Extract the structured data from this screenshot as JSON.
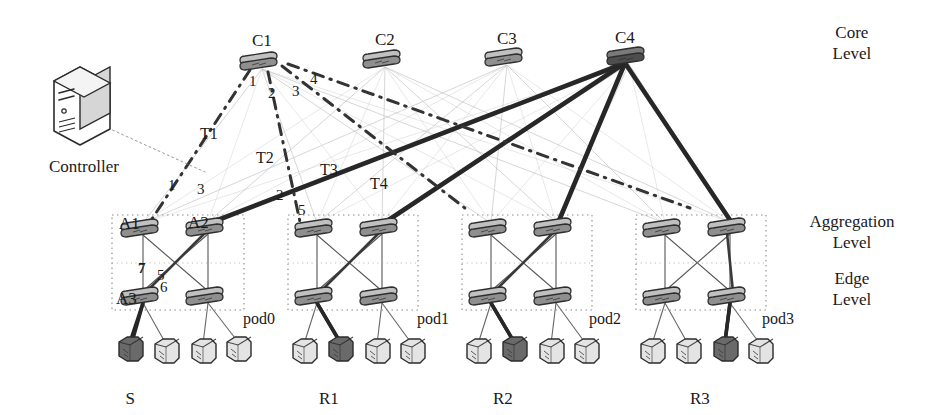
{
  "diagram": {
    "levels": [
      {
        "id": "core",
        "label_line1": "Core",
        "label_line2": "Level",
        "x": 852,
        "y": 22
      },
      {
        "id": "aggregation",
        "label_line1": "Aggregation",
        "label_line2": "Level",
        "x": 852,
        "y": 211
      },
      {
        "id": "edge",
        "label_line1": "Edge",
        "label_line2": "Level",
        "x": 852,
        "y": 268
      }
    ],
    "controller": {
      "label": "Controller",
      "x": 84,
      "y": 105,
      "label_x": 84,
      "label_y": 158
    },
    "core_switches": [
      {
        "id": "C1",
        "label": "C1",
        "x": 262,
        "y": 62,
        "label_x": 262,
        "label_y": 32
      },
      {
        "id": "C2",
        "label": "C2",
        "x": 385,
        "y": 60,
        "label_x": 385,
        "label_y": 31
      },
      {
        "id": "C3",
        "label": "C3",
        "x": 507,
        "y": 58,
        "label_x": 507,
        "label_y": 30
      },
      {
        "id": "C4",
        "label": "C4",
        "x": 629,
        "y": 57,
        "label_x": 625,
        "label_y": 29
      }
    ],
    "pods": [
      {
        "id": "pod0",
        "label": "pod0",
        "label_x": 243,
        "label_y": 311,
        "box": {
          "x": 112,
          "y": 215,
          "w": 132,
          "h": 95
        },
        "agg": [
          {
            "id": "A1",
            "label": "A1",
            "x": 143,
            "y": 229,
            "label_x": 119,
            "label_y": 215
          },
          {
            "id": "A2",
            "label": "A2",
            "x": 208,
            "y": 228,
            "label_x": 188,
            "label_y": 214
          }
        ],
        "edge": [
          {
            "id": "A3",
            "label": "A3",
            "x": 143,
            "y": 297,
            "label_x": 116,
            "label_y": 290
          },
          {
            "id": "E0b",
            "label": "",
            "x": 208,
            "y": 297,
            "label_x": 0,
            "label_y": 0
          }
        ],
        "hosts": [
          {
            "x": 130,
            "y": 350,
            "highlight": true,
            "label": "S",
            "label_x": 130,
            "label_y": 390
          },
          {
            "x": 166,
            "y": 352,
            "highlight": false,
            "label": "",
            "label_x": 0,
            "label_y": 0
          },
          {
            "x": 203,
            "y": 352,
            "highlight": false,
            "label": "",
            "label_x": 0,
            "label_y": 0
          },
          {
            "x": 238,
            "y": 350,
            "highlight": false,
            "label": "",
            "label_x": 0,
            "label_y": 0
          }
        ]
      },
      {
        "id": "pod1",
        "label": "pod1",
        "label_x": 417,
        "label_y": 311,
        "box": {
          "x": 288,
          "y": 215,
          "w": 130,
          "h": 95
        },
        "agg": [
          {
            "id": "A4",
            "label": "",
            "x": 317,
            "y": 229,
            "label_x": 0,
            "label_y": 0
          },
          {
            "id": "A5",
            "label": "",
            "x": 382,
            "y": 228,
            "label_x": 0,
            "label_y": 0
          }
        ],
        "edge": [
          {
            "id": "E1a",
            "label": "",
            "x": 317,
            "y": 297,
            "label_x": 0,
            "label_y": 0
          },
          {
            "id": "E1b",
            "label": "",
            "x": 382,
            "y": 297,
            "label_x": 0,
            "label_y": 0
          }
        ],
        "hosts": [
          {
            "x": 304,
            "y": 352,
            "highlight": false,
            "label": "",
            "label_x": 0,
            "label_y": 0
          },
          {
            "x": 340,
            "y": 350,
            "highlight": true,
            "label": "R1",
            "label_x": 329,
            "label_y": 390
          },
          {
            "x": 377,
            "y": 352,
            "highlight": false,
            "label": "",
            "label_x": 0,
            "label_y": 0
          },
          {
            "x": 412,
            "y": 352,
            "highlight": false,
            "label": "",
            "label_x": 0,
            "label_y": 0
          }
        ]
      },
      {
        "id": "pod2",
        "label": "pod2",
        "label_x": 589,
        "label_y": 311,
        "box": {
          "x": 462,
          "y": 215,
          "w": 130,
          "h": 95
        },
        "agg": [
          {
            "id": "A6",
            "label": "",
            "x": 491,
            "y": 229,
            "label_x": 0,
            "label_y": 0
          },
          {
            "id": "A7",
            "label": "",
            "x": 556,
            "y": 228,
            "label_x": 0,
            "label_y": 0
          }
        ],
        "edge": [
          {
            "id": "E2a",
            "label": "",
            "x": 491,
            "y": 297,
            "label_x": 0,
            "label_y": 0
          },
          {
            "id": "E2b",
            "label": "",
            "x": 556,
            "y": 297,
            "label_x": 0,
            "label_y": 0
          }
        ],
        "hosts": [
          {
            "x": 478,
            "y": 352,
            "highlight": false,
            "label": "",
            "label_x": 0,
            "label_y": 0
          },
          {
            "x": 514,
            "y": 350,
            "highlight": true,
            "label": "R2",
            "label_x": 503,
            "label_y": 390
          },
          {
            "x": 551,
            "y": 352,
            "highlight": false,
            "label": "",
            "label_x": 0,
            "label_y": 0
          },
          {
            "x": 586,
            "y": 352,
            "highlight": false,
            "label": "",
            "label_x": 0,
            "label_y": 0
          }
        ]
      },
      {
        "id": "pod3",
        "label": "pod3",
        "label_x": 762,
        "label_y": 311,
        "box": {
          "x": 636,
          "y": 215,
          "w": 130,
          "h": 95
        },
        "agg": [
          {
            "id": "A8",
            "label": "",
            "x": 665,
            "y": 229,
            "label_x": 0,
            "label_y": 0
          },
          {
            "id": "A9",
            "label": "",
            "x": 730,
            "y": 228,
            "label_x": 0,
            "label_y": 0
          }
        ],
        "edge": [
          {
            "id": "E3a",
            "label": "",
            "x": 665,
            "y": 297,
            "label_x": 0,
            "label_y": 0
          },
          {
            "id": "E3b",
            "label": "",
            "x": 730,
            "y": 297,
            "label_x": 0,
            "label_y": 0
          }
        ],
        "hosts": [
          {
            "x": 652,
            "y": 352,
            "highlight": false,
            "label": "",
            "label_x": 0,
            "label_y": 0
          },
          {
            "x": 688,
            "y": 352,
            "highlight": false,
            "label": "",
            "label_x": 0,
            "label_y": 0
          },
          {
            "x": 725,
            "y": 350,
            "highlight": true,
            "label": "R3",
            "label_x": 700,
            "label_y": 390
          },
          {
            "x": 760,
            "y": 352,
            "highlight": false,
            "label": "",
            "label_x": 0,
            "label_y": 0
          }
        ]
      }
    ],
    "flow_labels": [
      {
        "text": "T1",
        "x": 200,
        "y": 126
      },
      {
        "text": "T2",
        "x": 256,
        "y": 150
      },
      {
        "text": "T3",
        "x": 320,
        "y": 162
      },
      {
        "text": "T4",
        "x": 370,
        "y": 176
      }
    ],
    "port_numbers": [
      {
        "text": "1",
        "x": 249,
        "y": 74,
        "bold": false
      },
      {
        "text": "2",
        "x": 268,
        "y": 86,
        "bold": false
      },
      {
        "text": "3",
        "x": 292,
        "y": 84,
        "bold": false
      },
      {
        "text": "4",
        "x": 310,
        "y": 72,
        "bold": false
      },
      {
        "text": "1",
        "x": 168,
        "y": 178,
        "bold": false
      },
      {
        "text": "3",
        "x": 197,
        "y": 182,
        "bold": false
      },
      {
        "text": "2",
        "x": 276,
        "y": 188,
        "bold": false
      },
      {
        "text": "5",
        "x": 298,
        "y": 203,
        "bold": false
      },
      {
        "text": "7",
        "x": 138,
        "y": 261,
        "bold": true
      },
      {
        "text": "5",
        "x": 157,
        "y": 268,
        "bold": false
      },
      {
        "text": "6",
        "x": 160,
        "y": 280,
        "bold": false
      }
    ],
    "legend_note": ""
  },
  "colors": {
    "ink": "#1a1a1a",
    "flow_dark": "#2b2b2b",
    "control_dash": "#3a3a3a",
    "faint_link": "#b9b9b9",
    "pod_box": "#8a8a8a",
    "host_fill": "#e4e4e4",
    "host_fill_hl": "#6a6a6a",
    "switch_fill": "#9a9a9a",
    "switch_dark": "#4a4a4a"
  }
}
